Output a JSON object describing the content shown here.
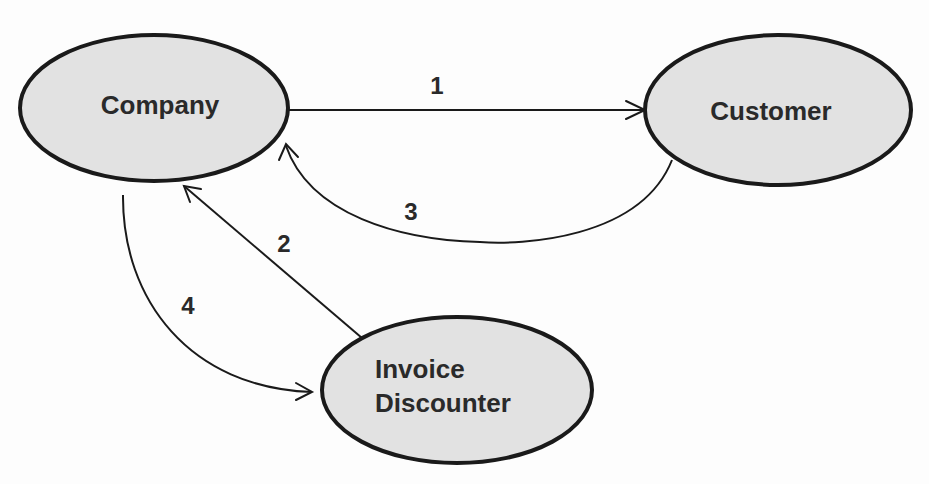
{
  "diagram": {
    "type": "flow",
    "nodes": [
      {
        "id": "company",
        "label": "Company",
        "cx": 154,
        "cy": 108,
        "rx": 134,
        "ry": 73
      },
      {
        "id": "customer",
        "label": "Customer",
        "cx": 778,
        "cy": 110,
        "rx": 133,
        "ry": 75
      },
      {
        "id": "invoice_discounter",
        "label_line1": "Invoice",
        "label_line2": "Discounter",
        "cx": 457,
        "cy": 390,
        "rx": 135,
        "ry": 73
      }
    ],
    "edges": [
      {
        "id": "e1",
        "from": "company",
        "to": "customer",
        "label": "1"
      },
      {
        "id": "e2",
        "from": "invoice_discounter",
        "to": "company",
        "label": "2"
      },
      {
        "id": "e3",
        "from": "customer",
        "to": "company",
        "label": "3"
      },
      {
        "id": "e4",
        "from": "company",
        "to": "invoice_discounter",
        "label": "4"
      }
    ],
    "colors": {
      "fill": "#e2e2e2",
      "stroke": "#1a1a1a",
      "text": "#2a2a2a"
    }
  }
}
